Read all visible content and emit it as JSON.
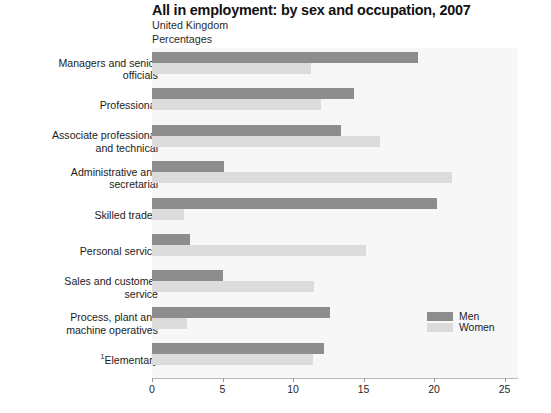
{
  "header": {
    "title": "All in employment: by sex and occupation, 2007",
    "subtitle_region": "United Kingdom",
    "subtitle_units": "Percentages"
  },
  "legend": {
    "position": "inside-right-lower",
    "items": [
      {
        "label": "Men",
        "color": "#8d8d8d"
      },
      {
        "label": "Women",
        "color": "#dcdcdc"
      }
    ]
  },
  "axis": {
    "ticks": [
      {
        "label": "0",
        "value": 0
      },
      {
        "label": "5",
        "value": 5
      },
      {
        "label": "10",
        "value": 10
      },
      {
        "label": "15",
        "value": 15
      },
      {
        "label": "20",
        "value": 20
      },
      {
        "label": "25",
        "value": 25
      }
    ]
  },
  "footnote_marker": "1",
  "chart_data": {
    "type": "bar",
    "orientation": "horizontal",
    "title": "All in employment: by sex and occupation, 2007",
    "subtitle": "United Kingdom",
    "xlabel": "Percentages",
    "ylabel": "",
    "xlim": [
      0,
      25
    ],
    "grid": false,
    "legend_position": "inside-right-lower",
    "categories": [
      "Managers and senior\nofficials",
      "Professional",
      "Associate professional\nand technical",
      "Administrative and\nsecretarial",
      "Skilled trades",
      "Personal service",
      "Sales and customer\nservice",
      "Process, plant and\nmachine operatives",
      "Elementary"
    ],
    "series": [
      {
        "name": "Men",
        "color": "#8d8d8d",
        "values": [
          18.9,
          14.3,
          13.4,
          5.1,
          20.2,
          2.7,
          5.0,
          12.6,
          12.2
        ]
      },
      {
        "name": "Women",
        "color": "#dcdcdc",
        "values": [
          11.3,
          12.0,
          16.2,
          21.3,
          2.3,
          15.2,
          11.5,
          2.5,
          11.4
        ]
      }
    ]
  }
}
